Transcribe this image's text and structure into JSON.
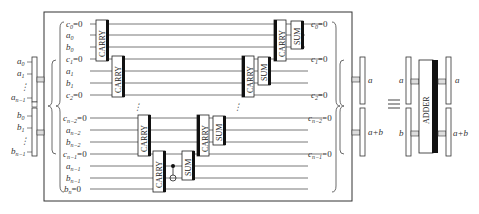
{
  "diagram": {
    "left_registers": {
      "a": {
        "labels": [
          "a0",
          "a1",
          "⋮",
          "an−1"
        ]
      },
      "b": {
        "labels": [
          "b0",
          "b1",
          "⋮",
          "bn−1"
        ]
      }
    },
    "input_wires": [
      "c0=0",
      "a0",
      "b0",
      "c1=0",
      "a1",
      "b1",
      "c2=0",
      "cn−2=0",
      "an−2",
      "bn−2",
      "cn−1=0",
      "an−1",
      "bn−1",
      "bn=0"
    ],
    "output_wires": [
      "c0=0",
      "c1=0",
      "c2=0",
      "cn−2=0",
      "cn−1=0"
    ],
    "gates": [
      {
        "type": "CARRY",
        "label": "CARRY"
      },
      {
        "type": "CARRY",
        "label": "CARRY"
      },
      {
        "type": "CARRY",
        "label": "CARRY"
      },
      {
        "type": "CARRY",
        "label": "CARRY"
      },
      {
        "type": "CNOT",
        "label": ""
      },
      {
        "type": "SUM",
        "label": "SUM"
      },
      {
        "type": "CARRY",
        "label": "CARRY"
      },
      {
        "type": "SUM",
        "label": "SUM"
      },
      {
        "type": "CARRY",
        "label": "CARRY"
      },
      {
        "type": "SUM",
        "label": "SUM"
      },
      {
        "type": "CARRY",
        "label": "CARRY"
      },
      {
        "type": "SUM",
        "label": "SUM"
      }
    ],
    "right_registers": {
      "top": "a",
      "bottom": "a+b"
    },
    "equivalence_symbol": "≡",
    "adder_block": {
      "label": "ADDER",
      "inputs": [
        "a",
        "b"
      ],
      "outputs": [
        "a",
        "a+b"
      ]
    },
    "ellipsis": "⋮"
  }
}
